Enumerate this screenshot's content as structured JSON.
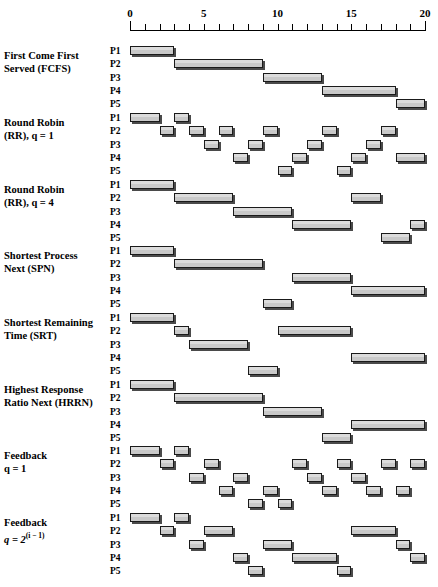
{
  "figure": {
    "axis": {
      "label": "",
      "min": 0,
      "max": 20,
      "tick_interval": 1,
      "labeled_ticks": [
        {
          "value": 0,
          "text": "0"
        },
        {
          "value": 5,
          "text": "5"
        },
        {
          "value": 10,
          "text": "10"
        },
        {
          "value": 15,
          "text": "15"
        },
        {
          "value": 20,
          "text": "20"
        }
      ]
    },
    "process_labels": [
      "P1",
      "P2",
      "P3",
      "P4",
      "P5"
    ],
    "bar_fill_color": "#c9c9c9",
    "bar_edge_color": "#1a1a1a",
    "bar_shadow_color": "#4a4a4a"
  },
  "chart_data": {
    "type": "bar",
    "xlabel": "Time",
    "ylabel": "Process",
    "xlim": [
      0,
      20
    ],
    "categories": [
      "P1",
      "P2",
      "P3",
      "P4",
      "P5"
    ],
    "grid": false,
    "legend": "none",
    "algorithms": [
      {
        "name_line1": "First Come First",
        "name_line2": "Served (FCFS)",
        "key": "fcfs",
        "segments": [
          {
            "process": "P1",
            "start": 0,
            "end": 3
          },
          {
            "process": "P2",
            "start": 3,
            "end": 9
          },
          {
            "process": "P3",
            "start": 9,
            "end": 13
          },
          {
            "process": "P4",
            "start": 13,
            "end": 18
          },
          {
            "process": "P5",
            "start": 18,
            "end": 20
          }
        ]
      },
      {
        "name_line1": "Round Robin",
        "name_line2": "(RR), q = 1",
        "key": "rr1",
        "segments": [
          {
            "process": "P1",
            "start": 0,
            "end": 2
          },
          {
            "process": "P2",
            "start": 2,
            "end": 3
          },
          {
            "process": "P1",
            "start": 3,
            "end": 4
          },
          {
            "process": "P2",
            "start": 4,
            "end": 5
          },
          {
            "process": "P3",
            "start": 5,
            "end": 6
          },
          {
            "process": "P2",
            "start": 6,
            "end": 7
          },
          {
            "process": "P4",
            "start": 7,
            "end": 8
          },
          {
            "process": "P3",
            "start": 8,
            "end": 9
          },
          {
            "process": "P2",
            "start": 9,
            "end": 10
          },
          {
            "process": "P5",
            "start": 10,
            "end": 11
          },
          {
            "process": "P4",
            "start": 11,
            "end": 12
          },
          {
            "process": "P3",
            "start": 12,
            "end": 13
          },
          {
            "process": "P2",
            "start": 13,
            "end": 14
          },
          {
            "process": "P5",
            "start": 14,
            "end": 15
          },
          {
            "process": "P4",
            "start": 15,
            "end": 16
          },
          {
            "process": "P3",
            "start": 16,
            "end": 17
          },
          {
            "process": "P2",
            "start": 17,
            "end": 18
          },
          {
            "process": "P4",
            "start": 18,
            "end": 20
          }
        ]
      },
      {
        "name_line1": "Round Robin",
        "name_line2": "(RR), q = 4",
        "key": "rr4",
        "segments": [
          {
            "process": "P1",
            "start": 0,
            "end": 3
          },
          {
            "process": "P2",
            "start": 3,
            "end": 7
          },
          {
            "process": "P3",
            "start": 7,
            "end": 11
          },
          {
            "process": "P4",
            "start": 11,
            "end": 15
          },
          {
            "process": "P2",
            "start": 15,
            "end": 17
          },
          {
            "process": "P5",
            "start": 17,
            "end": 19
          },
          {
            "process": "P4",
            "start": 19,
            "end": 20
          }
        ]
      },
      {
        "name_line1": "Shortest Process",
        "name_line2": "Next (SPN)",
        "key": "spn",
        "segments": [
          {
            "process": "P1",
            "start": 0,
            "end": 3
          },
          {
            "process": "P2",
            "start": 3,
            "end": 9
          },
          {
            "process": "P5",
            "start": 9,
            "end": 11
          },
          {
            "process": "P3",
            "start": 11,
            "end": 15
          },
          {
            "process": "P4",
            "start": 15,
            "end": 20
          }
        ]
      },
      {
        "name_line1": "Shortest Remaining",
        "name_line2": "Time (SRT)",
        "key": "srt",
        "segments": [
          {
            "process": "P1",
            "start": 0,
            "end": 3
          },
          {
            "process": "P2",
            "start": 3,
            "end": 4
          },
          {
            "process": "P3",
            "start": 4,
            "end": 8
          },
          {
            "process": "P5",
            "start": 8,
            "end": 10
          },
          {
            "process": "P2",
            "start": 10,
            "end": 15
          },
          {
            "process": "P4",
            "start": 15,
            "end": 20
          }
        ]
      },
      {
        "name_line1": "Highest Response",
        "name_line2": "Ratio Next (HRRN)",
        "key": "hrrn",
        "segments": [
          {
            "process": "P1",
            "start": 0,
            "end": 3
          },
          {
            "process": "P2",
            "start": 3,
            "end": 9
          },
          {
            "process": "P3",
            "start": 9,
            "end": 13
          },
          {
            "process": "P5",
            "start": 13,
            "end": 15
          },
          {
            "process": "P4",
            "start": 15,
            "end": 20
          }
        ]
      },
      {
        "name_line1": "Feedback",
        "name_line2": "q = 1",
        "key": "fb1",
        "segments": [
          {
            "process": "P1",
            "start": 0,
            "end": 2
          },
          {
            "process": "P2",
            "start": 2,
            "end": 3
          },
          {
            "process": "P1",
            "start": 3,
            "end": 4
          },
          {
            "process": "P3",
            "start": 4,
            "end": 5
          },
          {
            "process": "P2",
            "start": 5,
            "end": 6
          },
          {
            "process": "P4",
            "start": 6,
            "end": 7
          },
          {
            "process": "P3",
            "start": 7,
            "end": 8
          },
          {
            "process": "P5",
            "start": 8,
            "end": 9
          },
          {
            "process": "P4",
            "start": 9,
            "end": 10
          },
          {
            "process": "P5",
            "start": 10,
            "end": 11
          },
          {
            "process": "P2",
            "start": 11,
            "end": 12
          },
          {
            "process": "P3",
            "start": 12,
            "end": 13
          },
          {
            "process": "P4",
            "start": 13,
            "end": 14
          },
          {
            "process": "P2",
            "start": 14,
            "end": 15
          },
          {
            "process": "P3",
            "start": 15,
            "end": 16
          },
          {
            "process": "P4",
            "start": 16,
            "end": 17
          },
          {
            "process": "P2",
            "start": 17,
            "end": 18
          },
          {
            "process": "P4",
            "start": 18,
            "end": 19
          },
          {
            "process": "P2",
            "start": 19,
            "end": 20
          }
        ]
      },
      {
        "name_line1": "Feedback",
        "name_line2_prefix": "q = 2",
        "name_line2_sup": "(i − 1)",
        "key": "fb2i",
        "segments": [
          {
            "process": "P1",
            "start": 0,
            "end": 2
          },
          {
            "process": "P2",
            "start": 2,
            "end": 3
          },
          {
            "process": "P1",
            "start": 3,
            "end": 4
          },
          {
            "process": "P3",
            "start": 4,
            "end": 5
          },
          {
            "process": "P2",
            "start": 5,
            "end": 7
          },
          {
            "process": "P4",
            "start": 7,
            "end": 8
          },
          {
            "process": "P5",
            "start": 8,
            "end": 9
          },
          {
            "process": "P3",
            "start": 9,
            "end": 11
          },
          {
            "process": "P4",
            "start": 11,
            "end": 14
          },
          {
            "process": "P5",
            "start": 14,
            "end": 15
          },
          {
            "process": "P2",
            "start": 15,
            "end": 18
          },
          {
            "process": "P3",
            "start": 18,
            "end": 19
          },
          {
            "process": "P4",
            "start": 19,
            "end": 20
          }
        ]
      }
    ]
  }
}
